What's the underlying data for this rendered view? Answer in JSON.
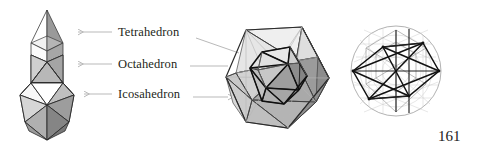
{
  "figure": {
    "background_color": "#ffffff",
    "labels": [
      {
        "id": "tetrahedron",
        "text": "Tetrahedron"
      },
      {
        "id": "octahedron",
        "text": "Octahedron"
      },
      {
        "id": "icosahedron",
        "text": "Icosahedron"
      }
    ],
    "page_number": "161",
    "arrows": [
      {
        "id": "tetrahedron-left-arrow",
        "direction": "left",
        "points_to": "tetrahedron-solid"
      },
      {
        "id": "octahedron-left-arrow",
        "direction": "left",
        "points_to": "octahedron-solid"
      },
      {
        "id": "icosahedron-left-arrow",
        "direction": "left",
        "points_to": "icosahedron-solid"
      },
      {
        "id": "tetrahedron-right-leader",
        "direction": "right-down",
        "points_to": "compound-figure"
      },
      {
        "id": "octahedron-right-leader",
        "direction": "right",
        "points_to": "compound-figure"
      },
      {
        "id": "icosahedron-right-arrow",
        "direction": "right",
        "points_to": "compound-figure"
      }
    ],
    "panels": [
      {
        "id": "stacked-solids",
        "caption": "Stacked tetrahedron, octahedron and icosahedron tower"
      },
      {
        "id": "compound-figure",
        "caption": "Nested icosahedron compound"
      },
      {
        "id": "circular-projection",
        "caption": "Circular wireframe projection of the compound"
      }
    ],
    "colors": {
      "ink": "#231f20",
      "arrow": "#b9b9b9",
      "outline_dark": "#1a1a1a",
      "outline_mid": "#5a5a5a",
      "outline_light": "#a8a8a8",
      "face_white": "#ffffff",
      "face_light": "#e2e2e2",
      "face_mid": "#bdbdbd",
      "face_dark": "#9a9a9a",
      "face_darker": "#7d7d7d"
    }
  }
}
